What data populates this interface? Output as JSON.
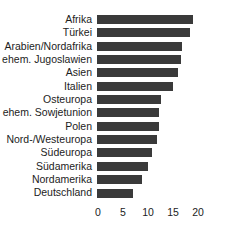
{
  "chart_data": {
    "type": "bar",
    "orientation": "horizontal",
    "title": "",
    "subtitle": "",
    "xlabel": "",
    "ylabel": "",
    "xlim": [
      0,
      20
    ],
    "ylim": null,
    "grid": false,
    "legend": null,
    "legend_position": "none",
    "bar_color": "#3a3a3a",
    "background_color": "#ffffff",
    "text_color": "#1c1c1c",
    "xticks": [
      "0",
      "5",
      "10",
      "15",
      "20"
    ],
    "xtick_values": [
      0,
      5,
      10,
      15,
      20
    ],
    "categories": [
      "Afrika",
      "Türkei",
      "Arabien/Nordafrika",
      "ehem. Jugoslawien",
      "Asien",
      "Italien",
      "Osteuropa",
      "ehem. Sowjetunion",
      "Polen",
      "Nord-/Westeuropa",
      "Südeuropa",
      "Südamerika",
      "Nordamerika",
      "Deutschland"
    ],
    "values": [
      19.2,
      18.6,
      17.0,
      16.8,
      16.2,
      15.2,
      12.8,
      12.4,
      12.4,
      12.0,
      11.0,
      10.2,
      9.0,
      7.2
    ],
    "bars": [
      {
        "category": "Afrika",
        "value": 19.2
      },
      {
        "category": "Türkei",
        "value": 18.6
      },
      {
        "category": "Arabien/Nordafrika",
        "value": 17.0
      },
      {
        "category": "ehem. Jugoslawien",
        "value": 16.8
      },
      {
        "category": "Asien",
        "value": 16.2
      },
      {
        "category": "Italien",
        "value": 15.2
      },
      {
        "category": "Osteuropa",
        "value": 12.8
      },
      {
        "category": "ehem. Sowjetunion",
        "value": 12.4
      },
      {
        "category": "Polen",
        "value": 12.4
      },
      {
        "category": "Nord-/Westeuropa",
        "value": 12.0
      },
      {
        "category": "Südeuropa",
        "value": 11.0
      },
      {
        "category": "Südamerika",
        "value": 10.2
      },
      {
        "category": "Nordamerika",
        "value": 9.0
      },
      {
        "category": "Deutschland",
        "value": 7.2
      }
    ]
  }
}
